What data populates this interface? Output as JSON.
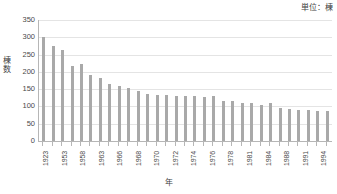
{
  "chart_data": {
    "type": "bar",
    "title": "",
    "subtitle": "",
    "unit_caption": "単位：棟",
    "xlabel": "年",
    "ylabel": "棟数",
    "ylabel_chars": [
      "棟",
      "数"
    ],
    "ylim": [
      0,
      350
    ],
    "ytick_step": 50,
    "yticks": [
      350,
      300,
      250,
      200,
      150,
      100,
      50,
      0
    ],
    "ytick_labels": [
      "350",
      "300",
      "250",
      "200",
      "150",
      "100",
      "50",
      "0"
    ],
    "grid": true,
    "grid_axis": "y",
    "legend": false,
    "legend_position": "none",
    "bar_color": "#a9a9a9",
    "gridline_color": "#e4e4e4",
    "axis_color": "#b6b6b6",
    "categories": [
      "1923",
      "1952",
      "1953",
      "1956",
      "1958",
      "1961",
      "1963",
      "1965",
      "1966",
      "1967",
      "1968",
      "1969",
      "1970",
      "1971",
      "1972",
      "1973",
      "1974",
      "1975",
      "1976",
      "1977",
      "1978",
      "1980",
      "1981",
      "1983",
      "1984",
      "1986",
      "1988",
      "1990",
      "1991",
      "1993",
      "1994"
    ],
    "xtick_labels_visible": [
      "1923",
      "",
      "1953",
      "",
      "1958",
      "",
      "1963",
      "",
      "1966",
      "",
      "1968",
      "",
      "1970",
      "",
      "1972",
      "",
      "1974",
      "",
      "1976",
      "",
      "1978",
      "",
      "1981",
      "",
      "1984",
      "",
      "1988",
      "",
      "1991",
      "",
      "1994"
    ],
    "values": [
      300,
      274,
      263,
      216,
      222,
      192,
      181,
      165,
      158,
      153,
      144,
      137,
      133,
      132,
      131,
      131,
      129,
      128,
      129,
      115,
      116,
      111,
      111,
      105,
      111,
      95,
      93,
      89,
      89,
      88,
      88
    ],
    "series": [
      {
        "name": "棟数",
        "values": [
          300,
          274,
          263,
          216,
          222,
          192,
          181,
          165,
          158,
          153,
          144,
          137,
          133,
          132,
          131,
          131,
          129,
          128,
          129,
          115,
          116,
          111,
          111,
          105,
          111,
          95,
          93,
          89,
          89,
          88,
          88
        ]
      }
    ]
  }
}
